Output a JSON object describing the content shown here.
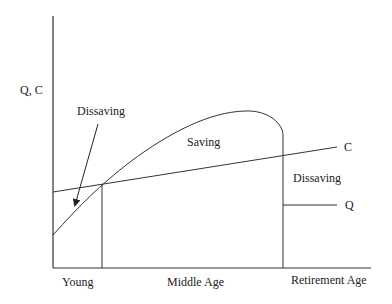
{
  "diagram": {
    "y_axis_label": "Q, C",
    "x_axis_labels": [
      "Young",
      "Middle Age",
      "Retirement Age"
    ],
    "curve_labels": {
      "consumption": "C",
      "income": "Q"
    },
    "region_labels": {
      "dissaving_young": "Dissaving",
      "saving": "Saving",
      "dissaving_retirement": "Dissaving"
    },
    "colors": {
      "line": "#333333",
      "background": "#ffffff"
    }
  }
}
